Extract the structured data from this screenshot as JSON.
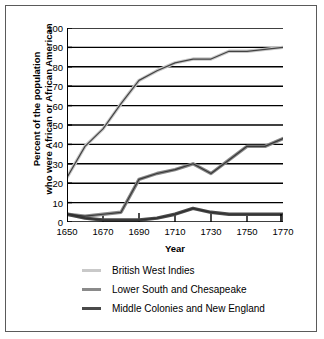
{
  "chart_data": {
    "type": "line",
    "title": "",
    "xlabel": "Year",
    "ylabel": "Percent of the population who were African or African American",
    "ylabel_line1": "Percent of the population",
    "ylabel_line2": "who were African or African American",
    "xlim": [
      1650,
      1770
    ],
    "ylim": [
      0,
      100
    ],
    "grid": true,
    "legend_position": "bottom",
    "xticks": [
      1650,
      1670,
      1690,
      1710,
      1730,
      1750,
      1770
    ],
    "yticks": [
      0,
      10,
      20,
      30,
      40,
      50,
      60,
      70,
      80,
      90,
      100
    ],
    "x": [
      1650,
      1660,
      1670,
      1680,
      1690,
      1700,
      1710,
      1720,
      1730,
      1740,
      1750,
      1760,
      1770
    ],
    "series": [
      {
        "name": "British West Indies",
        "color": "#c9c9c9",
        "values": [
          23,
          39,
          48,
          61,
          73,
          78,
          82,
          84,
          84,
          88,
          88,
          89,
          90
        ]
      },
      {
        "name": "Lower South and Chesapeake",
        "color": "#8a8a8a",
        "values": [
          4,
          3,
          4,
          5,
          22,
          25,
          27,
          30,
          25,
          32,
          39,
          39,
          43
        ]
      },
      {
        "name": "Middle Colonies and New England",
        "color": "#4a4a4a",
        "values": [
          4,
          2,
          1,
          1,
          1,
          2,
          4,
          7,
          5,
          4,
          4,
          4,
          4
        ]
      }
    ]
  },
  "legend": {
    "items": [
      {
        "label": "British West Indies",
        "color": "#c9c9c9"
      },
      {
        "label": "Lower South and Chesapeake",
        "color": "#8a8a8a"
      },
      {
        "label": "Middle Colonies and New England",
        "color": "#4a4a4a"
      }
    ]
  },
  "colors": {
    "border": "#5a5a5a",
    "gridline": "#000000",
    "axis": "#000000",
    "background": "#ffffff"
  }
}
